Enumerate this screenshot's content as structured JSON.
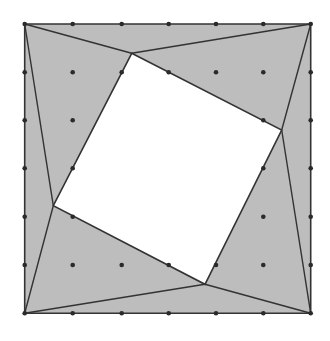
{
  "diagram": {
    "title": "",
    "colors": {
      "background": "#ffffff",
      "fill_outer": "#bdbdbd",
      "fill_inner": "#ffffff",
      "stroke": "#333333",
      "dot": "#2a2a2a"
    },
    "grid": {
      "columns": 7,
      "rows": 7,
      "x": [
        24.7,
        72.7,
        121.7,
        168.7,
        216,
        263.3,
        310.7
      ],
      "y": [
        24,
        72.3,
        120.3,
        168.3,
        216.7,
        265,
        313.3
      ]
    },
    "outer_square": {
      "top_left": [
        24.7,
        24
      ],
      "top_right": [
        310.7,
        24
      ],
      "bottom_right": [
        310.7,
        313.3
      ],
      "bottom_left": [
        24.7,
        313.3
      ]
    },
    "inner_square": {
      "top": [
        131.7,
        53.3
      ],
      "right": [
        281.7,
        130
      ],
      "bottom": [
        205,
        284.3
      ],
      "left": [
        53.3,
        205.7
      ]
    },
    "connector_lines": [
      {
        "from": "top_left",
        "to": "top"
      },
      {
        "from": "top_right",
        "to": "top"
      },
      {
        "from": "top_right",
        "to": "right"
      },
      {
        "from": "bottom_right",
        "to": "right"
      },
      {
        "from": "bottom_right",
        "to": "bottom"
      },
      {
        "from": "bottom_left",
        "to": "bottom"
      },
      {
        "from": "bottom_left",
        "to": "left"
      },
      {
        "from": "top_left",
        "to": "left"
      }
    ],
    "hidden_grid_points": [
      [
        2,
        2
      ],
      [
        2,
        3
      ],
      [
        2,
        4
      ],
      [
        3,
        2
      ],
      [
        3,
        3
      ],
      [
        3,
        4
      ],
      [
        4,
        2
      ],
      [
        4,
        3
      ],
      [
        4,
        4
      ]
    ]
  }
}
